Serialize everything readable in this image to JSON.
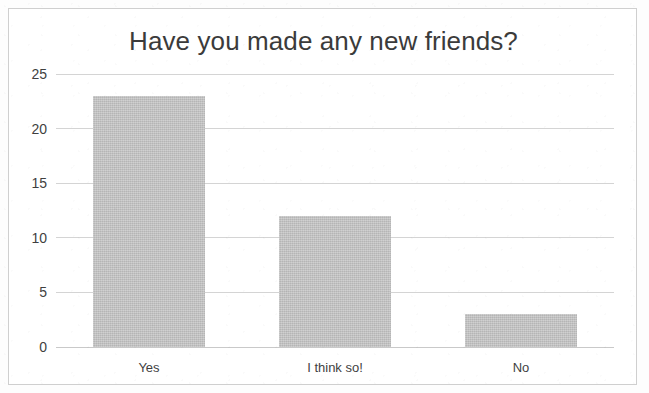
{
  "chart_data": {
    "type": "bar",
    "title": "Have you made any new friends?",
    "categories": [
      "Yes",
      "I think so!",
      "No"
    ],
    "values": [
      23,
      12,
      3
    ],
    "xlabel": "",
    "ylabel": "",
    "ylim": [
      0,
      25
    ],
    "yticks": [
      0,
      5,
      10,
      15,
      20,
      25
    ],
    "ytick_labels": [
      "0",
      "5",
      "10",
      "15",
      "20",
      "25"
    ],
    "grid": true,
    "legend": false,
    "bar_color": "#c2c2c2",
    "gridline_color": "#d4d4d4",
    "title_color": "#3b3b3b",
    "tick_label_color": "#3f3f3f",
    "frame_color": "#cfcfcf",
    "background_color": "#ffffff"
  }
}
